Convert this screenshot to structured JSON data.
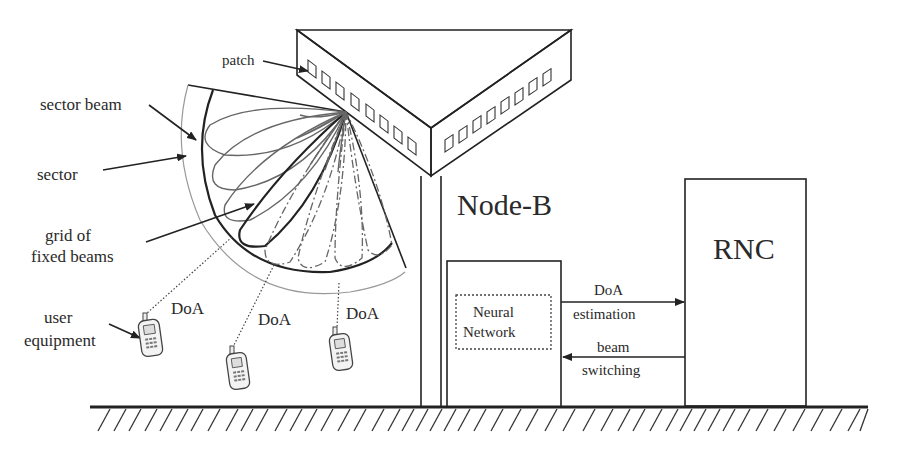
{
  "diagram": {
    "labels": {
      "patch": "patch",
      "sector_beam": "sector beam",
      "sector": "sector",
      "grid_line1": "grid of",
      "grid_line2": "fixed beams",
      "user_line1": "user",
      "user_line2": "equipment",
      "doa_1": "DoA",
      "doa_2": "DoA",
      "doa_3": "DoA",
      "node_b": "Node-B",
      "rnc": "RNC",
      "nn_line1": "Neural",
      "nn_line2": "Network",
      "doa_est_line1": "DoA",
      "doa_est_line2": "estimation",
      "beam_sw_line1": "beam",
      "beam_sw_line2": "switching"
    },
    "antenna": {
      "left_face_patches": 8,
      "right_face_patches": 8
    },
    "user_equipment_count": 3,
    "colors": {
      "line": "#222222",
      "beam": "#666666",
      "sector": "#999999",
      "text": "#2a2a2a",
      "background": "#ffffff"
    }
  }
}
